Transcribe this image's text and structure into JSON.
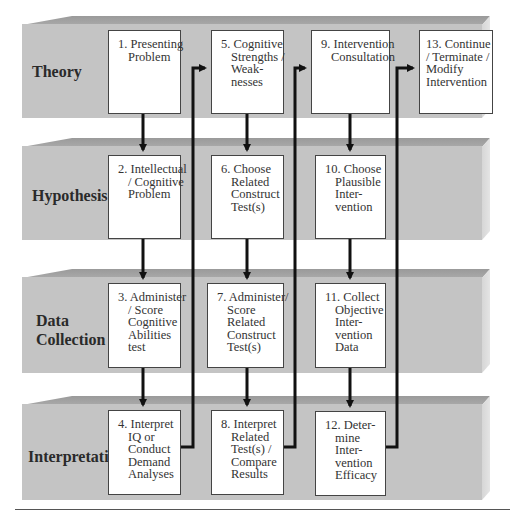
{
  "rows": [
    {
      "label": "Theory"
    },
    {
      "label": "Hypothesis"
    },
    {
      "label_lines": [
        "Data",
        "Collection"
      ]
    },
    {
      "label": "Interpretation"
    }
  ],
  "boxes": {
    "b1": {
      "lines": [
        "1. Presenting",
        "Problem"
      ]
    },
    "b2": {
      "lines": [
        "2. Intellectual",
        "/ Cognitive",
        "Problem"
      ]
    },
    "b3": {
      "lines": [
        "3. Administer",
        "/ Score",
        "Cognitive",
        "Abilities",
        "test"
      ]
    },
    "b4": {
      "lines": [
        "4. Interpret",
        "IQ or",
        "Conduct",
        "Demand",
        "Analyses"
      ]
    },
    "b5": {
      "lines": [
        "5. Cognitive",
        "Strengths /",
        "Weak-",
        "nesses"
      ]
    },
    "b6": {
      "lines": [
        "6. Choose",
        "Related",
        "Construct",
        "Test(s)"
      ]
    },
    "b7": {
      "lines": [
        "7. Administer/",
        "Score",
        "Related",
        "Construct",
        "Test(s)"
      ]
    },
    "b8": {
      "lines": [
        "8. Interpret",
        "Related",
        "Test(s) /",
        "Compare",
        "Results"
      ]
    },
    "b9": {
      "lines": [
        "9. Intervention",
        "Consultation"
      ]
    },
    "b10": {
      "lines": [
        "10. Choose",
        "Plausible",
        "Inter-",
        "vention"
      ]
    },
    "b11": {
      "lines": [
        "11. Collect",
        "Objective",
        "Inter-",
        "vention",
        "Data"
      ]
    },
    "b12": {
      "lines": [
        "12. Deter-",
        "mine",
        "Inter-",
        "vention",
        "Efficacy"
      ]
    },
    "b13": {
      "lines": [
        "13. Continue",
        "/ Terminate /",
        "Modify",
        "Intervention"
      ]
    }
  },
  "colors": {
    "band_front": "#c4c4c4",
    "band_top": "#a3a3a3",
    "arrow": "#111111",
    "box_border": "#444444"
  }
}
